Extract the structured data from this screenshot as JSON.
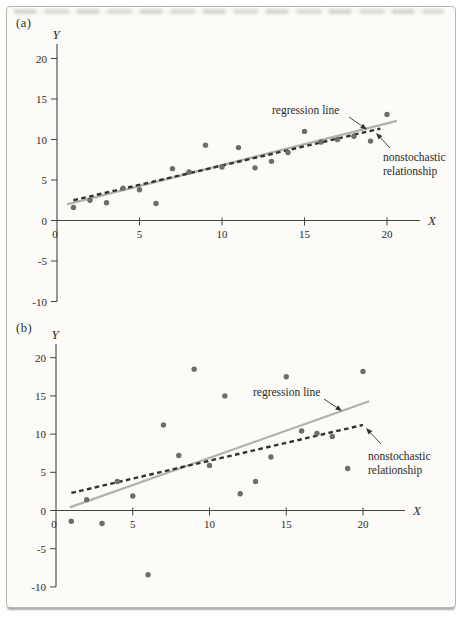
{
  "page": {
    "panel_a_label": "(a)",
    "panel_b_label": "(b)"
  },
  "colors": {
    "page_background": "#fcfbf8",
    "border": "#b7b6b2",
    "axis": "#45443f",
    "text": "#2b2a27",
    "dot": "#6e6d67",
    "regression_line": "#b2b1ad",
    "nonstochastic_line": "#33322f"
  },
  "chart_data": [
    {
      "type": "scatter",
      "panel_label": "(a)",
      "xlabel": "X",
      "ylabel": "Y",
      "xlim": [
        0,
        22
      ],
      "ylim": [
        -10,
        21
      ],
      "x_ticks": [
        0,
        5,
        10,
        15,
        20
      ],
      "y_ticks": [
        20,
        15,
        10,
        5,
        0,
        -5,
        -10
      ],
      "x": [
        1,
        2,
        3,
        4,
        5,
        6,
        7,
        8,
        9,
        10,
        11,
        12,
        13,
        14,
        15,
        16,
        17,
        18,
        19,
        20
      ],
      "y": [
        1.6,
        2.5,
        2.2,
        4.0,
        3.8,
        2.1,
        6.4,
        6.0,
        9.3,
        6.6,
        9.0,
        6.5,
        7.3,
        8.4,
        11.0,
        9.7,
        10.0,
        10.4,
        9.8,
        13.1
      ],
      "regression_line": {
        "label": "regression line",
        "x1": 0.6,
        "y1": 2.0,
        "x2": 20.6,
        "y2": 12.3
      },
      "nonstochastic_line": {
        "label": "nonstochastic relationship",
        "label_lines": [
          "nonstochastic",
          "relationship"
        ],
        "x1": 1.0,
        "y1": 2.5,
        "x2": 19.6,
        "y2": 11.35
      }
    },
    {
      "type": "scatter",
      "panel_label": "(b)",
      "xlabel": "X",
      "ylabel": "Y",
      "xlim": [
        0,
        22
      ],
      "ylim": [
        -10,
        21
      ],
      "x_ticks": [
        0,
        5,
        10,
        15,
        20
      ],
      "y_ticks": [
        20,
        15,
        10,
        5,
        0,
        -5,
        -10
      ],
      "x": [
        1,
        2,
        3,
        4,
        5,
        6,
        7,
        8,
        9,
        10,
        11,
        12,
        13,
        14,
        15,
        16,
        17,
        18,
        19,
        20
      ],
      "y": [
        -1.4,
        1.4,
        -1.7,
        3.8,
        1.9,
        -8.4,
        11.2,
        7.2,
        18.5,
        5.9,
        15.0,
        2.2,
        3.8,
        7.0,
        17.5,
        10.4,
        10.1,
        9.7,
        5.5,
        18.2
      ],
      "regression_line": {
        "label": "regression line",
        "x1": 0.9,
        "y1": 0.4,
        "x2": 20.4,
        "y2": 14.3
      },
      "nonstochastic_line": {
        "label": "nonstochastic relationship",
        "label_lines": [
          "nonstochastic",
          "relationship"
        ],
        "x1": 1.0,
        "y1": 2.3,
        "x2": 20.0,
        "y2": 11.2
      }
    }
  ]
}
